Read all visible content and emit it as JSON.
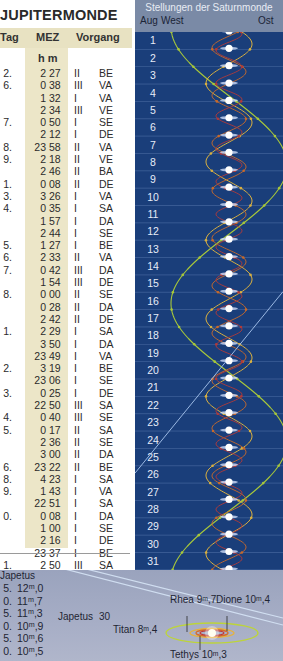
{
  "jupiter_table": {
    "title": "JUPITERMONDE",
    "headers": {
      "day": "Tag",
      "time": "MEZ",
      "event": "Vorgang"
    },
    "time_units": "h m",
    "rows": [
      {
        "day": "2.",
        "h": "2",
        "m": "27",
        "moon": "II",
        "ev": "BE"
      },
      {
        "day": "6.",
        "h": "0",
        "m": "38",
        "moon": "III",
        "ev": "VA"
      },
      {
        "day": "",
        "h": "1",
        "m": "32",
        "moon": "I",
        "ev": "VA"
      },
      {
        "day": "",
        "h": "2",
        "m": "34",
        "moon": "III",
        "ev": "VE"
      },
      {
        "day": "7.",
        "h": "0",
        "m": "50",
        "moon": "I",
        "ev": "SE"
      },
      {
        "day": "",
        "h": "2",
        "m": "12",
        "moon": "I",
        "ev": "DE"
      },
      {
        "day": "8.",
        "h": "23",
        "m": "58",
        "moon": "II",
        "ev": "VA"
      },
      {
        "day": "9.",
        "h": "2",
        "m": "18",
        "moon": "II",
        "ev": "VE"
      },
      {
        "day": "",
        "h": "2",
        "m": "46",
        "moon": "II",
        "ev": "BA"
      },
      {
        "day": "1.",
        "h": "0",
        "m": "08",
        "moon": "II",
        "ev": "DE"
      },
      {
        "day": "3.",
        "h": "3",
        "m": "26",
        "moon": "I",
        "ev": "VA"
      },
      {
        "day": "4.",
        "h": "0",
        "m": "35",
        "moon": "I",
        "ev": "SA"
      },
      {
        "day": "",
        "h": "1",
        "m": "57",
        "moon": "I",
        "ev": "DA"
      },
      {
        "day": "",
        "h": "2",
        "m": "44",
        "moon": "I",
        "ev": "SE"
      },
      {
        "day": "5.",
        "h": "1",
        "m": "27",
        "moon": "I",
        "ev": "BE"
      },
      {
        "day": "6.",
        "h": "2",
        "m": "33",
        "moon": "II",
        "ev": "VA"
      },
      {
        "day": "7.",
        "h": "0",
        "m": "42",
        "moon": "III",
        "ev": "DA"
      },
      {
        "day": "",
        "h": "1",
        "m": "54",
        "moon": "III",
        "ev": "DE"
      },
      {
        "day": "8.",
        "h": "0",
        "m": "00",
        "moon": "II",
        "ev": "SE"
      },
      {
        "day": "",
        "h": "0",
        "m": "28",
        "moon": "II",
        "ev": "DA"
      },
      {
        "day": "",
        "h": "2",
        "m": "42",
        "moon": "II",
        "ev": "DE"
      },
      {
        "day": "1.",
        "h": "2",
        "m": "29",
        "moon": "I",
        "ev": "SA"
      },
      {
        "day": "",
        "h": "3",
        "m": "50",
        "moon": "I",
        "ev": "DA"
      },
      {
        "day": "",
        "h": "23",
        "m": "49",
        "moon": "I",
        "ev": "VA"
      },
      {
        "day": "2.",
        "h": "3",
        "m": "19",
        "moon": "I",
        "ev": "BE"
      },
      {
        "day": "",
        "h": "23",
        "m": "06",
        "moon": "I",
        "ev": "SE"
      },
      {
        "day": "3.",
        "h": "0",
        "m": "25",
        "moon": "I",
        "ev": "DE"
      },
      {
        "day": "",
        "h": "22",
        "m": "50",
        "moon": "III",
        "ev": "SA"
      },
      {
        "day": "4.",
        "h": "0",
        "m": "40",
        "moon": "III",
        "ev": "SE"
      },
      {
        "day": "5.",
        "h": "0",
        "m": "17",
        "moon": "II",
        "ev": "SA"
      },
      {
        "day": "",
        "h": "2",
        "m": "36",
        "moon": "II",
        "ev": "SE"
      },
      {
        "day": "",
        "h": "3",
        "m": "00",
        "moon": "II",
        "ev": "DA"
      },
      {
        "day": "6.",
        "h": "23",
        "m": "22",
        "moon": "II",
        "ev": "BE"
      },
      {
        "day": "8.",
        "h": "4",
        "m": "23",
        "moon": "I",
        "ev": "SA"
      },
      {
        "day": "9.",
        "h": "1",
        "m": "43",
        "moon": "I",
        "ev": "VA"
      },
      {
        "day": "",
        "h": "22",
        "m": "51",
        "moon": "I",
        "ev": "SA"
      },
      {
        "day": "0.",
        "h": "0",
        "m": "08",
        "moon": "I",
        "ev": "DA"
      },
      {
        "day": "",
        "h": "1",
        "m": "00",
        "moon": "I",
        "ev": "SE"
      },
      {
        "day": "",
        "h": "2",
        "m": "16",
        "moon": "I",
        "ev": "DE"
      },
      {
        "day": "",
        "h": "23",
        "m": "37",
        "moon": "I",
        "ev": "BE"
      },
      {
        "day": "1.",
        "h": "2",
        "m": "50",
        "moon": "III",
        "ev": "SA"
      },
      {
        "day": "",
        "h": "4",
        "m": "40",
        "moon": "III",
        "ev": "SE"
      }
    ]
  },
  "saturn_chart": {
    "title": "Stellungen der Saturnmonde",
    "col_month": "Aug",
    "col_west": "West",
    "col_east": "Ost",
    "days": [
      "1",
      "2",
      "3",
      "4",
      "5",
      "6",
      "7",
      "8",
      "9",
      "10",
      "11",
      "12",
      "13",
      "14",
      "15",
      "16",
      "17",
      "18",
      "19",
      "20",
      "21",
      "22",
      "23",
      "24",
      "25",
      "26",
      "27",
      "28",
      "29",
      "30",
      "31"
    ],
    "colors": {
      "background": "#1a3e7a",
      "header": "#7a8aa6",
      "titan": "#a8c83a",
      "rhea": "#d9b040",
      "dione": "#c86a2a",
      "tethys": "#b03a3a",
      "iapetus": "#a9c6ee",
      "gridline": "#5a7ab0"
    }
  },
  "bottom": {
    "iapetus_header": "Japetus",
    "iapetus_mags": [
      {
        "d": "5.",
        "v": "12ᵐ,0"
      },
      {
        "d": "0.",
        "v": "11ᵐ,7"
      },
      {
        "d": "5.",
        "v": "11ᵐ,3"
      },
      {
        "d": "0.",
        "v": "10ᵐ,9"
      },
      {
        "d": "5.",
        "v": "10ᵐ,6"
      },
      {
        "d": "0.",
        "v": "10ᵐ,5"
      }
    ],
    "iapetus_label": "Japetus",
    "iapetus_day": "30",
    "titan_label": "Titan 8ᵐ,4",
    "rhea_label": "Rhea 9ᵐ,7",
    "dione_label": "Dione 10ᵐ,4",
    "tethys_label": "Tethys 10ᵐ,3"
  },
  "chart_data": {
    "type": "line",
    "title": "Stellungen der Saturnmonde",
    "xlabel": "West ← → Ost",
    "ylabel": "Aug",
    "y_categories": [
      "1",
      "2",
      "3",
      "4",
      "5",
      "6",
      "7",
      "8",
      "9",
      "10",
      "11",
      "12",
      "13",
      "14",
      "15",
      "16",
      "17",
      "18",
      "19",
      "20",
      "21",
      "22",
      "23",
      "24",
      "25",
      "26",
      "27",
      "28",
      "29",
      "30",
      "31"
    ],
    "series": [
      {
        "name": "Titan",
        "period_days": 15.95,
        "amplitude_rel": 1.0
      },
      {
        "name": "Rhea",
        "period_days": 4.52,
        "amplitude_rel": 0.42
      },
      {
        "name": "Dione",
        "period_days": 2.74,
        "amplitude_rel": 0.3
      },
      {
        "name": "Tethys",
        "period_days": 1.89,
        "amplitude_rel": 0.24
      },
      {
        "name": "Japetus",
        "type": "trend",
        "note": "diagonal line from west to east, days 15-26"
      }
    ],
    "grid": true
  }
}
